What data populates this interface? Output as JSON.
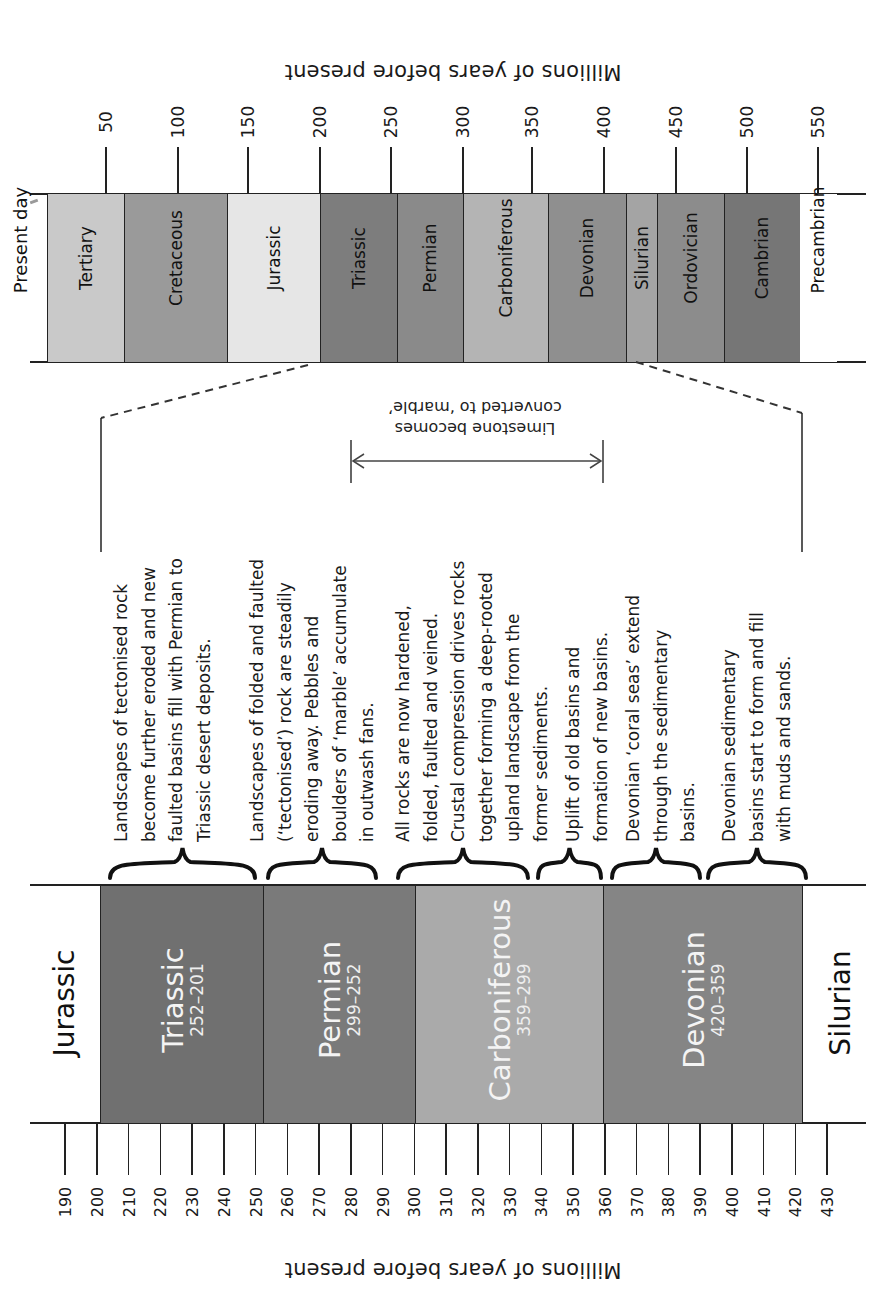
{
  "top_axis": {
    "title": "Millions of years before present",
    "ticks": [
      {
        "label": "50",
        "x": 106
      },
      {
        "label": "100",
        "x": 178
      },
      {
        "label": "150",
        "x": 248
      },
      {
        "label": "200",
        "x": 320
      },
      {
        "label": "250",
        "x": 391
      },
      {
        "label": "300",
        "x": 463
      },
      {
        "label": "350",
        "x": 532
      },
      {
        "label": "400",
        "x": 604
      },
      {
        "label": "450",
        "x": 676
      },
      {
        "label": "500",
        "x": 747
      },
      {
        "label": "550",
        "x": 818
      }
    ]
  },
  "overview_timeline": {
    "start_label": "Present day",
    "periods": [
      {
        "name": "Tertiary",
        "x0": 47,
        "x1": 124,
        "color": "#c9c9c9"
      },
      {
        "name": "Cretaceous",
        "x0": 124,
        "x1": 227,
        "color": "#9a9a9a"
      },
      {
        "name": "Jurassic",
        "x0": 227,
        "x1": 320,
        "color": "#e6e6e6"
      },
      {
        "name": "Triassic",
        "x0": 320,
        "x1": 397,
        "color": "#7d7d7d"
      },
      {
        "name": "Permian",
        "x0": 397,
        "x1": 463,
        "color": "#8a8a8a"
      },
      {
        "name": "Carboniferous",
        "x0": 463,
        "x1": 548,
        "color": "#b4b4b4"
      },
      {
        "name": "Devonian",
        "x0": 548,
        "x1": 626,
        "color": "#8f8f8f"
      },
      {
        "name": "Silurian",
        "x0": 626,
        "x1": 657,
        "color": "#a4a4a4"
      },
      {
        "name": "Ordovician",
        "x0": 657,
        "x1": 724,
        "color": "#8c8c8c"
      },
      {
        "name": "Cambrian",
        "x0": 724,
        "x1": 800,
        "color": "#767676"
      },
      {
        "name": "Precambrian",
        "x0": 800,
        "x1": 836,
        "color": "#ffffff"
      }
    ]
  },
  "annotation": {
    "line1": "Limestone becomes",
    "line2": "converted to ‘marble’"
  },
  "events": [
    {
      "lines": [
        "Landscapes of tectonised rock",
        "become further eroded and new",
        "faulted basins fill with Permian to",
        "Triassic desert deposits."
      ],
      "brace_x0": 110,
      "brace_x1": 255
    },
    {
      "lines": [
        "Landscapes of folded and faulted",
        "(‘tectonised’) rock are steadily",
        "eroding away. Pebbles and",
        "boulders of ‘marble’ accumulate",
        "in outwash fans."
      ],
      "brace_x0": 268,
      "brace_x1": 376
    },
    {
      "lines": [
        "All rocks are now hardened,",
        "folded, faulted and veined.",
        "Crustal compression drives rocks",
        "together forming a deep-rooted",
        "upland landscape from the",
        "former sediments."
      ],
      "brace_x0": 398,
      "brace_x1": 528
    },
    {
      "lines": [
        "Uplift of old basins and",
        "formation of new basins."
      ],
      "brace_x0": 538,
      "brace_x1": 601
    },
    {
      "lines": [
        "Devonian ‘coral seas’ extend",
        "through the sedimentary",
        "basins."
      ],
      "brace_x0": 612,
      "brace_x1": 700
    },
    {
      "lines": [
        "Devonian sedimentary",
        "basins start to form and fill",
        "with muds and sands."
      ],
      "brace_x0": 708,
      "brace_x1": 806
    }
  ],
  "detail_timeline": {
    "before_label": "Jurassic",
    "after_label": "Silurian",
    "periods": [
      {
        "name": "Triassic",
        "range": "252–201",
        "x0": 100,
        "x1": 263,
        "color": "#707070"
      },
      {
        "name": "Permian",
        "range": "299–252",
        "x0": 263,
        "x1": 415,
        "color": "#7a7a7a"
      },
      {
        "name": "Carboniferous",
        "range": "359–299",
        "x0": 415,
        "x1": 603,
        "color": "#aaaaaa"
      },
      {
        "name": "Devonian",
        "range": "420–359",
        "x0": 603,
        "x1": 802,
        "color": "#858585"
      }
    ]
  },
  "bottom_axis": {
    "title": "Millions of years before present",
    "ticks": [
      "190",
      "200",
      "210",
      "220",
      "230",
      "240",
      "250",
      "260",
      "270",
      "280",
      "290",
      "300",
      "310",
      "320",
      "330",
      "340",
      "350",
      "360",
      "370",
      "380",
      "390",
      "400",
      "410",
      "420",
      "430"
    ]
  },
  "chart_data": {
    "type": "table",
    "overview_periods": [
      "Tertiary",
      "Cretaceous",
      "Jurassic",
      "Triassic",
      "Permian",
      "Carboniferous",
      "Devonian",
      "Silurian",
      "Ordovician",
      "Cambrian",
      "Precambrian"
    ],
    "detail_periods": [
      {
        "name": "Triassic",
        "start_mya": 252,
        "end_mya": 201
      },
      {
        "name": "Permian",
        "start_mya": 299,
        "end_mya": 252
      },
      {
        "name": "Carboniferous",
        "start_mya": 359,
        "end_mya": 299
      },
      {
        "name": "Devonian",
        "start_mya": 420,
        "end_mya": 359
      }
    ],
    "axis_range_overview": [
      0,
      550
    ],
    "axis_range_detail": [
      190,
      430
    ]
  }
}
